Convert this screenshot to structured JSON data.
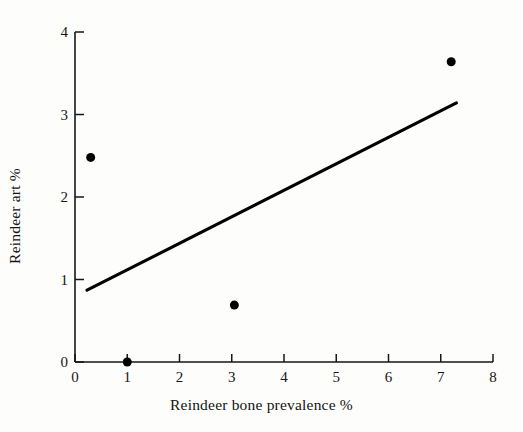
{
  "figure": {
    "background_color": "#fdfdfc",
    "ink_color": "#141414"
  },
  "axes": {
    "x_title": "Reindeer bone prevalence %",
    "y_title": "Reindeer art %",
    "x_ticks": [
      "0",
      "1",
      "2",
      "3",
      "4",
      "5",
      "6",
      "7",
      "8"
    ],
    "y_ticks": [
      "0",
      "1",
      "2",
      "3",
      "4"
    ]
  },
  "chart_data": {
    "type": "scatter",
    "title": "",
    "subtitle": "",
    "xlabel": "Reindeer bone prevalence %",
    "ylabel": "Reindeer art %",
    "xlim": [
      0,
      8
    ],
    "ylim": [
      0,
      4
    ],
    "xticks": [
      0,
      1,
      2,
      3,
      4,
      5,
      6,
      7,
      8
    ],
    "yticks": [
      0,
      1,
      2,
      3,
      4
    ],
    "grid": false,
    "legend": null,
    "marker_color": "#000000",
    "marker_shape": "filled-circle",
    "points": [
      {
        "x": 0.3,
        "y": 2.48
      },
      {
        "x": 1.0,
        "y": 0.0
      },
      {
        "x": 3.05,
        "y": 0.69
      },
      {
        "x": 7.2,
        "y": 3.64
      }
    ],
    "series": [
      {
        "name": "observations",
        "x": [
          0.3,
          1.0,
          3.05,
          7.2
        ],
        "y": [
          2.48,
          0.0,
          0.69,
          3.64
        ]
      }
    ],
    "trendline": {
      "type": "linear-fit",
      "color": "#000000",
      "x_start": 0.23,
      "y_start": 0.87,
      "x_end": 7.3,
      "y_end": 3.14,
      "slope": 0.321,
      "intercept": 0.796
    },
    "annotations": []
  }
}
